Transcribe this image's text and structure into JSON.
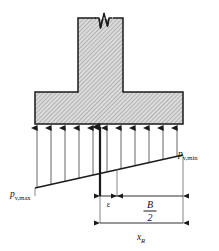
{
  "figure": {
    "type": "engineering-diagram",
    "background_color": "#ffffff",
    "line_color": "#1a1a1a",
    "hatch_fill_color": "#d2d2d2",
    "hatch_line_color": "#8a8a8a"
  },
  "labels": {
    "pressure_max": {
      "symbol": "p",
      "subscript": "v,max",
      "full": "pv,max"
    },
    "pressure_min": {
      "symbol": "p",
      "subscript": "v,min",
      "full": "pv,min"
    },
    "eccentricity": {
      "symbol": "ε",
      "full": "ε"
    },
    "half_width": {
      "numerator": "B",
      "denominator": "2",
      "full": "B/2"
    },
    "resultant_distance": {
      "symbol": "x",
      "subscript": "R",
      "full": "xR"
    }
  },
  "geometry": {
    "footing": {
      "left": 35,
      "right": 183,
      "top": 92,
      "bottom": 124
    },
    "column": {
      "left": 78,
      "right": 123,
      "top": 18,
      "bottom": 92
    },
    "break_symbol": "zigzag-break",
    "pressure_line": {
      "left_x": 35,
      "left_y": 188,
      "right_x": 183,
      "right_y": 155
    },
    "pressure_arrow_count": 11,
    "resultant_arrow_x": 100
  },
  "dimensions": {
    "epsilon_from": 100,
    "epsilon_to": 117,
    "half_width_from": 117,
    "half_width_to": 183,
    "x_r_from": 100,
    "x_r_to": 183
  },
  "annotations": {
    "break_line": "column-continues-above",
    "arrow_direction": "upward",
    "description": "Upward soil reaction pressure arrows beneath footing base, trapezoidal distribution"
  }
}
